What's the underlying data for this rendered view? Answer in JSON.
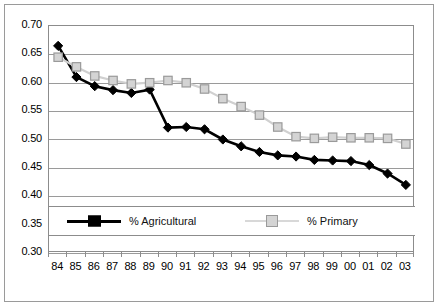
{
  "chart_data": {
    "type": "line",
    "title": "",
    "xlabel": "",
    "ylabel": "",
    "ylim": [
      0.3,
      0.7
    ],
    "ytick_step": 0.05,
    "grid": true,
    "legend_position": "inside-lower-left",
    "yticks": [
      "0.70",
      "0.65",
      "0.60",
      "0.55",
      "0.50",
      "0.45",
      "0.40",
      "0.35",
      "0.30"
    ],
    "categories": [
      "84",
      "85",
      "86",
      "87",
      "88",
      "89",
      "90",
      "91",
      "92",
      "93",
      "94",
      "95",
      "96",
      "97",
      "98",
      "99",
      "00",
      "01",
      "02",
      "03"
    ],
    "series": [
      {
        "name": "% Agricultural",
        "color": "#000000",
        "marker": "filled-diamond",
        "values": [
          0.665,
          0.61,
          0.594,
          0.587,
          0.582,
          0.588,
          0.521,
          0.522,
          0.518,
          0.5,
          0.488,
          0.478,
          0.472,
          0.47,
          0.464,
          0.463,
          0.462,
          0.455,
          0.44,
          0.42
        ]
      },
      {
        "name": "% Primary",
        "color": "#c9c9c9",
        "marker": "open-square",
        "values": [
          0.645,
          0.628,
          0.612,
          0.604,
          0.598,
          0.6,
          0.604,
          0.6,
          0.589,
          0.572,
          0.558,
          0.543,
          0.522,
          0.505,
          0.502,
          0.504,
          0.503,
          0.503,
          0.502,
          0.492
        ]
      }
    ],
    "legend": [
      {
        "label": "% Agricultural",
        "color": "#000000",
        "marker": "filled-square"
      },
      {
        "label": "% Primary",
        "color": "#cfcfcf",
        "marker": "open-square"
      }
    ]
  }
}
